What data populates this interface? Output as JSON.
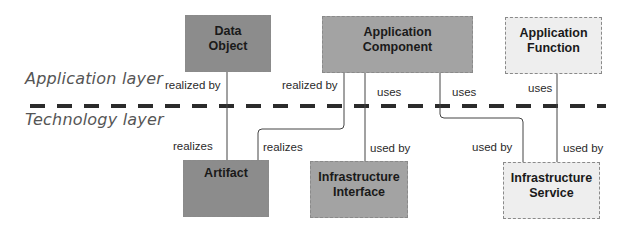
{
  "layers": {
    "top": "Application layer",
    "bottom": "Technology layer"
  },
  "nodes": [
    {
      "id": "data-object",
      "label": "Data\nObject",
      "line1": "Data",
      "line2": "Object",
      "fill": "#8c8c8c"
    },
    {
      "id": "application-component",
      "line1": "Application",
      "line2": "Component",
      "fill": "#a3a3a3"
    },
    {
      "id": "application-function",
      "line1": "Application",
      "line2": "Function",
      "fill": "#eeeeee"
    },
    {
      "id": "artifact",
      "line1": "Artifact",
      "line2": "",
      "fill": "#8c8c8c"
    },
    {
      "id": "infrastructure-interface",
      "line1": "Infrastructure",
      "line2": "Interface",
      "fill": "#a3a3a3"
    },
    {
      "id": "infrastructure-service",
      "line1": "Infrastructure",
      "line2": "Service",
      "fill": "#eeeeee"
    }
  ],
  "edges": [
    {
      "from": "artifact",
      "to": "data-object",
      "label_top": "realized by",
      "label_bottom": "realizes"
    },
    {
      "from": "artifact",
      "to": "application-component",
      "label_top": "realized by",
      "label_bottom": "realizes"
    },
    {
      "from": "application-component",
      "to": "infrastructure-interface",
      "label_top": "uses",
      "label_bottom": "used by"
    },
    {
      "from": "application-component",
      "to": "infrastructure-service",
      "label_top": "uses",
      "label_bottom": "used by"
    },
    {
      "from": "application-function",
      "to": "infrastructure-service",
      "label_top": "uses",
      "label_bottom": "used by"
    }
  ]
}
